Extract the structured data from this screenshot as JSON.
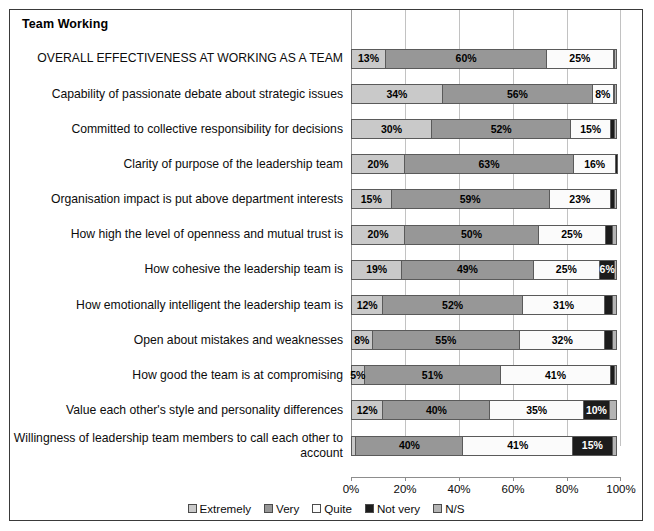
{
  "chart": {
    "title": "Team Working"
  },
  "legend": {
    "position": "bottom",
    "items": [
      {
        "label": "Extremely",
        "color": "#c9c9c9",
        "key": "extremely"
      },
      {
        "label": "Very",
        "color": "#979797",
        "key": "very"
      },
      {
        "label": "Quite",
        "color": "#fbfbfb",
        "key": "quite"
      },
      {
        "label": "Not very",
        "color": "#1c1c1c",
        "key": "notvery"
      },
      {
        "label": "N/S",
        "color": "#b4b4b4",
        "key": "ns"
      }
    ]
  },
  "axis": {
    "ticks": [
      "0%",
      "20%",
      "40%",
      "60%",
      "80%",
      "100%"
    ],
    "min": 0,
    "max": 100
  },
  "chart_data": {
    "type": "bar",
    "orientation": "horizontal",
    "stacked": true,
    "stack_mode": "percent",
    "title": "Team Working",
    "xlabel": "",
    "ylabel": "",
    "xlim": [
      0,
      100
    ],
    "grid": true,
    "legend_position": "bottom",
    "series": [
      {
        "name": "Extremely",
        "color": "#c9c9c9",
        "values": [
          13,
          34,
          30,
          20,
          15,
          20,
          19,
          12,
          8,
          5,
          12,
          2
        ]
      },
      {
        "name": "Very",
        "color": "#979797",
        "values": [
          60,
          56,
          52,
          63,
          59,
          50,
          49,
          52,
          55,
          51,
          40,
          40
        ]
      },
      {
        "name": "Quite",
        "color": "#fbfbfb",
        "values": [
          25,
          8,
          15,
          16,
          23,
          25,
          25,
          31,
          32,
          41,
          35,
          41
        ]
      },
      {
        "name": "Not very",
        "color": "#1c1c1c",
        "values": [
          1,
          1,
          2,
          1,
          2,
          3,
          6,
          3,
          3,
          2,
          10,
          15
        ]
      },
      {
        "name": "N/S",
        "color": "#b4b4b4",
        "values": [
          1,
          1,
          1,
          0,
          1,
          2,
          1,
          2,
          2,
          1,
          3,
          2
        ]
      }
    ],
    "categories": [
      "OVERALL EFFECTIVENESS AT WORKING AS A TEAM",
      "Capability of passionate debate about strategic issues",
      "Committed to collective responsibility for decisions",
      "Clarity of purpose of the leadership team",
      "Organisation impact is put above department interests",
      "How high the level of openness and mutual trust is",
      "How cohesive the leadership team is",
      "How emotionally intelligent the leadership team is",
      "Open about mistakes and weaknesses",
      "How good the team is at compromising",
      "Value each other's style and personality differences",
      "Willingness of leadership team members to call each other to account"
    ],
    "rows": [
      {
        "label": "OVERALL EFFECTIVENESS AT WORKING AS A TEAM",
        "segments": [
          {
            "key": "extremely",
            "value": 13,
            "label": "13%"
          },
          {
            "key": "very",
            "value": 60,
            "label": "60%"
          },
          {
            "key": "quite",
            "value": 25,
            "label": "25%"
          },
          {
            "key": "notvery",
            "value": 1,
            "label": ""
          },
          {
            "key": "ns",
            "value": 1,
            "label": ""
          }
        ]
      },
      {
        "label": "Capability of passionate debate about strategic issues",
        "segments": [
          {
            "key": "extremely",
            "value": 34,
            "label": "34%"
          },
          {
            "key": "very",
            "value": 56,
            "label": "56%"
          },
          {
            "key": "quite",
            "value": 8,
            "label": "8%"
          },
          {
            "key": "notvery",
            "value": 1,
            "label": ""
          },
          {
            "key": "ns",
            "value": 1,
            "label": ""
          }
        ]
      },
      {
        "label": "Committed to collective responsibility for decisions",
        "segments": [
          {
            "key": "extremely",
            "value": 30,
            "label": "30%"
          },
          {
            "key": "very",
            "value": 52,
            "label": "52%"
          },
          {
            "key": "quite",
            "value": 15,
            "label": "15%"
          },
          {
            "key": "notvery",
            "value": 2,
            "label": ""
          },
          {
            "key": "ns",
            "value": 1,
            "label": ""
          }
        ]
      },
      {
        "label": "Clarity of purpose of the leadership team",
        "segments": [
          {
            "key": "extremely",
            "value": 20,
            "label": "20%"
          },
          {
            "key": "very",
            "value": 63,
            "label": "63%"
          },
          {
            "key": "quite",
            "value": 16,
            "label": "16%"
          },
          {
            "key": "notvery",
            "value": 1,
            "label": ""
          },
          {
            "key": "ns",
            "value": 0,
            "label": ""
          }
        ]
      },
      {
        "label": "Organisation impact is put above department interests",
        "segments": [
          {
            "key": "extremely",
            "value": 15,
            "label": "15%"
          },
          {
            "key": "very",
            "value": 59,
            "label": "59%"
          },
          {
            "key": "quite",
            "value": 23,
            "label": "23%"
          },
          {
            "key": "notvery",
            "value": 2,
            "label": ""
          },
          {
            "key": "ns",
            "value": 1,
            "label": ""
          }
        ]
      },
      {
        "label": "How high the level of openness and mutual trust is",
        "segments": [
          {
            "key": "extremely",
            "value": 20,
            "label": "20%"
          },
          {
            "key": "very",
            "value": 50,
            "label": "50%"
          },
          {
            "key": "quite",
            "value": 25,
            "label": "25%"
          },
          {
            "key": "notvery",
            "value": 3,
            "label": ""
          },
          {
            "key": "ns",
            "value": 2,
            "label": ""
          }
        ]
      },
      {
        "label": "How cohesive the leadership team is",
        "segments": [
          {
            "key": "extremely",
            "value": 19,
            "label": "19%"
          },
          {
            "key": "very",
            "value": 49,
            "label": "49%"
          },
          {
            "key": "quite",
            "value": 25,
            "label": "25%"
          },
          {
            "key": "notvery",
            "value": 6,
            "label": "6%"
          },
          {
            "key": "ns",
            "value": 1,
            "label": ""
          }
        ]
      },
      {
        "label": "How emotionally intelligent the leadership team is",
        "segments": [
          {
            "key": "extremely",
            "value": 12,
            "label": "12%"
          },
          {
            "key": "very",
            "value": 52,
            "label": "52%"
          },
          {
            "key": "quite",
            "value": 31,
            "label": "31%"
          },
          {
            "key": "notvery",
            "value": 3,
            "label": ""
          },
          {
            "key": "ns",
            "value": 2,
            "label": ""
          }
        ]
      },
      {
        "label": "Open about mistakes and weaknesses",
        "segments": [
          {
            "key": "extremely",
            "value": 8,
            "label": "8%"
          },
          {
            "key": "very",
            "value": 55,
            "label": "55%"
          },
          {
            "key": "quite",
            "value": 32,
            "label": "32%"
          },
          {
            "key": "notvery",
            "value": 3,
            "label": ""
          },
          {
            "key": "ns",
            "value": 2,
            "label": ""
          }
        ]
      },
      {
        "label": "How good the team is at compromising",
        "segments": [
          {
            "key": "extremely",
            "value": 5,
            "label": "5%"
          },
          {
            "key": "very",
            "value": 51,
            "label": "51%"
          },
          {
            "key": "quite",
            "value": 41,
            "label": "41%"
          },
          {
            "key": "notvery",
            "value": 2,
            "label": ""
          },
          {
            "key": "ns",
            "value": 1,
            "label": ""
          }
        ]
      },
      {
        "label": "Value each other's style and personality differences",
        "segments": [
          {
            "key": "extremely",
            "value": 12,
            "label": "12%"
          },
          {
            "key": "very",
            "value": 40,
            "label": "40%"
          },
          {
            "key": "quite",
            "value": 35,
            "label": "35%"
          },
          {
            "key": "notvery",
            "value": 10,
            "label": "10%"
          },
          {
            "key": "ns",
            "value": 3,
            "label": ""
          }
        ]
      },
      {
        "label": "Willingness of leadership team members to call each other to account",
        "segments": [
          {
            "key": "extremely",
            "value": 2,
            "label": ""
          },
          {
            "key": "very",
            "value": 40,
            "label": "40%"
          },
          {
            "key": "quite",
            "value": 41,
            "label": "41%"
          },
          {
            "key": "notvery",
            "value": 15,
            "label": "15%"
          },
          {
            "key": "ns",
            "value": 2,
            "label": ""
          }
        ]
      }
    ]
  }
}
